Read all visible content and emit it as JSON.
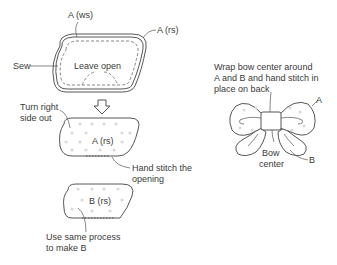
{
  "step1": {
    "label_ws": "A (ws)",
    "label_rs": "A (rs)",
    "label_sew": "Sew",
    "label_leave_open": "Leave open"
  },
  "step2": {
    "label_turn_line1": "Turn right",
    "label_turn_line2": "side out",
    "label_piece": "A (rs)",
    "label_stitch_line1": "Hand stitch the",
    "label_stitch_line2": "opening"
  },
  "step3": {
    "label_piece": "B (rs)",
    "label_process_line1": "Use same process",
    "label_process_line2": "to make B"
  },
  "bow": {
    "instr_line1": "Wrap bow center around",
    "instr_line2": "A and B and hand stitch in",
    "instr_line3": "place on back",
    "label_a": "A",
    "label_b": "B",
    "label_center_line1": "Bow",
    "label_center_line2": "center"
  },
  "colors": {
    "line": "#444444",
    "dots": "#d6d6d6",
    "text": "#3a3a3a"
  }
}
